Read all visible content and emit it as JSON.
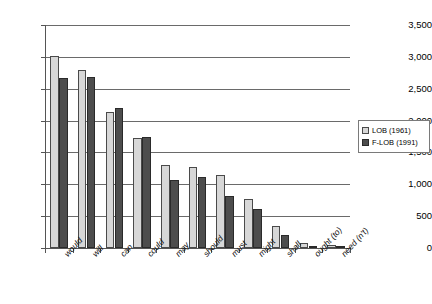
{
  "chart_data": {
    "type": "bar",
    "title": "",
    "subtitle": "",
    "xlabel": "",
    "ylabel": "",
    "ylim": [
      0,
      3500
    ],
    "ytick_step": 500,
    "grid": true,
    "legend_position": "right",
    "categories": [
      "would",
      "will",
      "can",
      "could",
      "may",
      "should",
      "must",
      "might",
      "shall",
      "ought (to)",
      "need (n't)"
    ],
    "ytick_labels": [
      "0",
      "500",
      "1,000",
      "1,500",
      "2,000",
      "2,500",
      "3,000",
      "3,500"
    ],
    "ytick_values": [
      0,
      500,
      1000,
      1500,
      2000,
      2500,
      3000,
      3500
    ],
    "series": [
      {
        "name": "LOB (1961)",
        "color": "#d7d7d7",
        "values": [
          3020,
          2800,
          2140,
          1720,
          1300,
          1270,
          1140,
          770,
          340,
          80,
          45
        ]
      },
      {
        "name": "F-LOB (1991)",
        "color": "#4d4d4d",
        "values": [
          2670,
          2690,
          2190,
          1740,
          1060,
          1120,
          810,
          620,
          200,
          35,
          25
        ]
      }
    ]
  },
  "legend": {
    "entries": [
      {
        "label": "LOB (1961)",
        "swatch": "lob"
      },
      {
        "label": "F-LOB (1991)",
        "swatch": "flob"
      }
    ]
  }
}
